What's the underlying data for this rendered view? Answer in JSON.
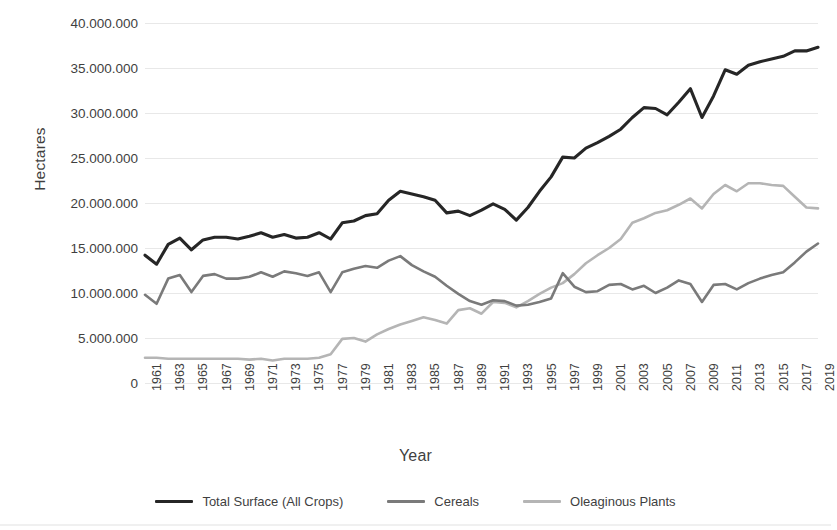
{
  "chart_data": {
    "type": "line",
    "title": "",
    "xlabel": "Year",
    "ylabel": "Hectares",
    "xlim": [
      1961,
      2019
    ],
    "ylim": [
      0,
      40000000
    ],
    "grid": true,
    "legend_position": "bottom",
    "y_ticks": [
      "0",
      "5.000.000",
      "10.000.000",
      "15.000.000",
      "20.000.000",
      "25.000.000",
      "30.000.000",
      "35.000.000",
      "40.000.000"
    ],
    "y_tick_values": [
      0,
      5000000,
      10000000,
      15000000,
      20000000,
      25000000,
      30000000,
      35000000,
      40000000
    ],
    "x_tick_labels": [
      "1961",
      "1963",
      "1965",
      "1967",
      "1969",
      "1971",
      "1973",
      "1975",
      "1977",
      "1979",
      "1981",
      "1983",
      "1985",
      "1987",
      "1989",
      "1991",
      "1993",
      "1995",
      "1997",
      "1999",
      "2001",
      "2003",
      "2005",
      "2007",
      "2009",
      "2011",
      "2013",
      "2015",
      "2017",
      "2019"
    ],
    "x": [
      1961,
      1962,
      1963,
      1964,
      1965,
      1966,
      1967,
      1968,
      1969,
      1970,
      1971,
      1972,
      1973,
      1974,
      1975,
      1976,
      1977,
      1978,
      1979,
      1980,
      1981,
      1982,
      1983,
      1984,
      1985,
      1986,
      1987,
      1988,
      1989,
      1990,
      1991,
      1992,
      1993,
      1994,
      1995,
      1996,
      1997,
      1998,
      1999,
      2000,
      2001,
      2002,
      2003,
      2004,
      2005,
      2006,
      2007,
      2008,
      2009,
      2010,
      2011,
      2012,
      2013,
      2014,
      2015,
      2016,
      2017,
      2018,
      2019
    ],
    "series": [
      {
        "name": "Total Surface (All Crops)",
        "color": "#262626",
        "values": [
          14200000,
          13200000,
          15400000,
          16100000,
          14800000,
          15900000,
          16200000,
          16200000,
          16000000,
          16300000,
          16700000,
          16200000,
          16500000,
          16100000,
          16200000,
          16700000,
          16000000,
          17800000,
          18000000,
          18600000,
          18800000,
          20300000,
          21300000,
          21000000,
          20700000,
          20300000,
          18900000,
          19100000,
          18600000,
          19200000,
          19900000,
          19300000,
          18100000,
          19500000,
          21300000,
          22900000,
          25100000,
          25000000,
          26100000,
          26700000,
          27400000,
          28200000,
          29500000,
          30600000,
          30500000,
          29800000,
          31200000,
          32700000,
          29500000,
          31900000,
          34800000,
          34300000,
          35300000,
          35700000,
          36000000,
          36300000,
          36900000,
          36900000,
          37300000
        ]
      },
      {
        "name": "Cereals",
        "color": "#7a7a7a",
        "values": [
          9800000,
          8800000,
          11600000,
          12000000,
          10100000,
          11900000,
          12100000,
          11600000,
          11600000,
          11800000,
          12300000,
          11800000,
          12400000,
          12200000,
          11900000,
          12300000,
          10100000,
          12300000,
          12700000,
          13000000,
          12800000,
          13600000,
          14100000,
          13100000,
          12400000,
          11800000,
          10800000,
          9900000,
          9100000,
          8700000,
          9200000,
          9100000,
          8600000,
          8700000,
          9000000,
          9400000,
          12200000,
          10700000,
          10100000,
          10200000,
          10900000,
          11000000,
          10400000,
          10800000,
          10000000,
          10600000,
          11400000,
          11000000,
          9000000,
          10900000,
          11000000,
          10400000,
          11100000,
          11600000,
          12000000,
          12300000,
          13400000,
          14600000,
          15500000
        ]
      },
      {
        "name": "Oleaginous Plants",
        "color": "#b5b5b5",
        "values": [
          2800000,
          2800000,
          2700000,
          2700000,
          2700000,
          2700000,
          2700000,
          2700000,
          2700000,
          2600000,
          2700000,
          2500000,
          2700000,
          2700000,
          2700000,
          2800000,
          3200000,
          4900000,
          5000000,
          4600000,
          5400000,
          6000000,
          6500000,
          6900000,
          7300000,
          7000000,
          6600000,
          8100000,
          8300000,
          7700000,
          9000000,
          8900000,
          8400000,
          9100000,
          9900000,
          10600000,
          11100000,
          12100000,
          13300000,
          14200000,
          15000000,
          16000000,
          17800000,
          18300000,
          18900000,
          19200000,
          19800000,
          20500000,
          19400000,
          21000000,
          22000000,
          21300000,
          22200000,
          22200000,
          22000000,
          21900000,
          20700000,
          19500000,
          19400000
        ]
      }
    ]
  },
  "axis": {
    "y_title": "Hectares",
    "x_title": "Year"
  },
  "legend": {
    "entries": [
      {
        "label": "Total Surface (All Crops)",
        "color": "#262626"
      },
      {
        "label": "Cereals",
        "color": "#7a7a7a"
      },
      {
        "label": "Oleaginous Plants",
        "color": "#b5b5b5"
      }
    ]
  }
}
